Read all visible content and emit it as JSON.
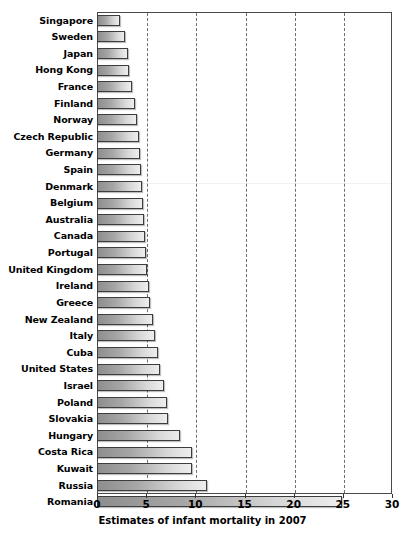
{
  "chart_data": {
    "type": "bar",
    "orientation": "horizontal",
    "title": "",
    "xlabel": "Estimates of infant mortality in 2007",
    "ylabel": "",
    "xlim": [
      0,
      30
    ],
    "xticks": [
      0,
      5,
      10,
      15,
      20,
      25,
      30
    ],
    "xtick_labels": [
      "0",
      "5",
      "10",
      "15",
      "20",
      "25",
      "30"
    ],
    "grid": "vertical dashed gridlines at 5,10,15,20,25",
    "legend": "none",
    "bar_color_start": "#8e8e8e",
    "bar_color_end": "#eeeeee",
    "bar_border_color": "#3d3d3d",
    "categories": [
      "Singapore",
      "Sweden",
      "Japan",
      "Hong Kong",
      "France",
      "Finland",
      "Norway",
      "Czech Republic",
      "Germany",
      "Spain",
      "Denmark",
      "Belgium",
      "Australia",
      "Canada",
      "Portugal",
      "United Kingdom",
      "Ireland",
      "Greece",
      "New Zealand",
      "Italy",
      "Cuba",
      "United States",
      "Israel",
      "Poland",
      "Slovakia",
      "Hungary",
      "Costa Rica",
      "Kuwait",
      "Russia",
      "Romania"
    ],
    "values": [
      2.3,
      2.8,
      3.2,
      3.3,
      3.6,
      3.9,
      4.1,
      4.3,
      4.4,
      4.5,
      4.6,
      4.7,
      4.8,
      4.9,
      5.0,
      5.1,
      5.3,
      5.4,
      5.7,
      5.9,
      6.2,
      6.4,
      6.8,
      7.1,
      7.2,
      8.4,
      9.7,
      9.7,
      11.2,
      24.9
    ]
  },
  "axis": {
    "title": "Estimates of infant mortality in 2007"
  }
}
